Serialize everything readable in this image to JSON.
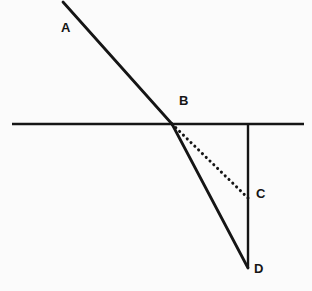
{
  "figure": {
    "kind": "geometry-diagram",
    "width": 312,
    "height": 291,
    "background_color": "#fbfbfb",
    "stroke_color": "#151515"
  },
  "labels": {
    "a": "A",
    "b": "B",
    "c": "C",
    "d": "D"
  },
  "chart_data": {
    "type": "scatter",
    "xlabel": "",
    "ylabel": "",
    "xlim": [
      0,
      312
    ],
    "ylim": [
      291,
      0
    ],
    "grid": false,
    "legend": "none",
    "points": [
      {
        "name": "A",
        "label": "A",
        "x": 63,
        "y": 2,
        "label_x": 62,
        "label_y": 34
      },
      {
        "name": "B",
        "label": "B",
        "x": 172,
        "y": 124,
        "label_x": 180,
        "label_y": 107
      },
      {
        "name": "C",
        "label": "C",
        "x": 248,
        "y": 198,
        "label_x": 257,
        "label_y": 200
      },
      {
        "name": "D",
        "label": "D",
        "x": 248,
        "y": 268,
        "label_x": 255,
        "label_y": 275
      }
    ],
    "segments": [
      {
        "name": "boundary-line",
        "description": "horizontal interface line",
        "from": [
          12,
          124
        ],
        "to": [
          304,
          124
        ],
        "style": "solid",
        "width": 2.6,
        "color": "#151515"
      },
      {
        "name": "incident-ray-AB",
        "description": "incident ray from A to B",
        "from": [
          63,
          2
        ],
        "to": [
          172,
          124
        ],
        "style": "solid",
        "width": 2.8,
        "color": "#151515"
      },
      {
        "name": "refracted-ray-BD",
        "description": "refracted ray from B to D",
        "from": [
          172,
          124
        ],
        "to": [
          248,
          268
        ],
        "style": "solid",
        "width": 2.8,
        "color": "#151515"
      },
      {
        "name": "normal-line",
        "description": "vertical normal line from boundary down to D",
        "from": [
          248,
          124
        ],
        "to": [
          248,
          268
        ],
        "style": "solid",
        "width": 2.4,
        "color": "#151515"
      },
      {
        "name": "undeviated-ray-BC",
        "description": "dotted continuation of incident ray from B to C",
        "from": [
          172,
          124
        ],
        "to": [
          248,
          198
        ],
        "style": "dotted",
        "width": 3.0,
        "dash": "0.1 5.2",
        "color": "#151515"
      }
    ]
  }
}
